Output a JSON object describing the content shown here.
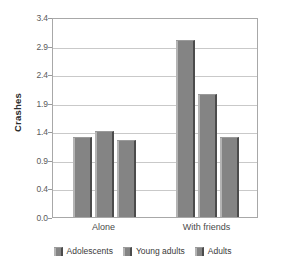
{
  "chart_data": {
    "type": "bar",
    "title": "",
    "subtitle": "",
    "xlabel": "",
    "ylabel": "Crashes",
    "categories": [
      "Alone",
      "With friends"
    ],
    "series": [
      {
        "name": "Adolescents",
        "values": [
          1.3,
          3.0
        ],
        "color": "#848484"
      },
      {
        "name": "Young adults",
        "values": [
          1.4,
          2.05
        ],
        "color": "#848484"
      },
      {
        "name": "Adults",
        "values": [
          1.25,
          1.3
        ],
        "color": "#848484"
      }
    ],
    "ylim": [
      0.0,
      3.4
    ],
    "yticks": [
      "0.0",
      "0.4",
      "0.9",
      "1.4",
      "1.9",
      "2.4",
      "2.9",
      "3.4"
    ],
    "ytick_values": [
      0.0,
      0.4,
      0.9,
      1.4,
      1.9,
      2.4,
      2.9,
      3.4
    ],
    "grid": true,
    "grid_axis": "y",
    "legend_position": "bottom",
    "legend": [
      "Adolescents",
      "Young adults",
      "Adults"
    ]
  },
  "axis": {
    "y_title": "Crashes"
  },
  "colors": {
    "bar_fill": "#848484",
    "bar_shadow": "#4c4c4c",
    "bar_highlight": "#b4b4b4",
    "gridline": "#c9c9c9",
    "frame": "#a8a8a8",
    "tick_text": "#5a5a5a",
    "background": "#ffffff"
  }
}
